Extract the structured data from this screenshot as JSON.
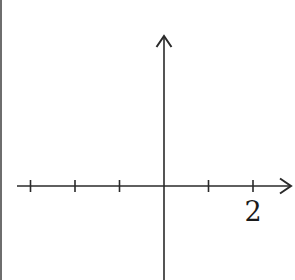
{
  "diagram": {
    "type": "coordinate-axes",
    "colors": {
      "axis": "#2a2a2a",
      "border": "#6e6e6e",
      "background": "#ffffff"
    },
    "x_axis": {
      "ticks": [
        -3,
        -2,
        -1,
        1,
        2
      ],
      "labeled_tick": {
        "value": 2,
        "label": "2"
      },
      "arrow": "right"
    },
    "y_axis": {
      "ticks": [],
      "arrow": "up"
    },
    "origin_px": {
      "x": 164,
      "y": 186
    },
    "unit_px": 44.5
  }
}
